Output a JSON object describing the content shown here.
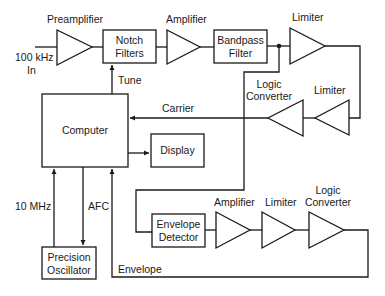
{
  "diagram": {
    "type": "block-diagram",
    "input": {
      "label_line1": "100 kHz",
      "label_line2": "In"
    },
    "main_chain": {
      "preamplifier": "Preamplifier",
      "notch_filters": {
        "line1": "Notch",
        "line2": "Filters"
      },
      "amplifier": "Amplifier",
      "bandpass_filter": {
        "line1": "Bandpass",
        "line2": "Filter"
      },
      "limiter": "Limiter"
    },
    "carrier_path": {
      "limiter": "Limiter",
      "logic_converter": {
        "line1": "Logic",
        "line2": "Converter"
      },
      "signal_label": "Carrier"
    },
    "computer": {
      "label": "Computer",
      "tune_label": "Tune"
    },
    "display": {
      "label": "Display"
    },
    "oscillator": {
      "label_line1": "Precision",
      "label_line2": "Oscillator",
      "ref_label": "10 MHz",
      "afc_label": "AFC"
    },
    "envelope_path": {
      "detector": {
        "line1": "Envelope",
        "line2": "Detector"
      },
      "amplifier": "Amplifier",
      "limiter": "Limiter",
      "logic_converter": {
        "line1": "Logic",
        "line2": "Converter"
      },
      "signal_label": "Envelope"
    }
  }
}
